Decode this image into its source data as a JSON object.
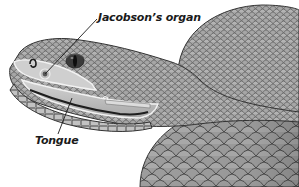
{
  "figure": {
    "labels": [
      {
        "id": "jacobsons-organ",
        "text": "Jacobson’s organ"
      },
      {
        "id": "tongue",
        "text": "Tongue"
      }
    ]
  },
  "colors": {
    "background": "#ffffff",
    "skin_light": "#b8b8b8",
    "skin_mid": "#9a9a9a",
    "skin_dark": "#6a6a6a",
    "scale_line": "#4a4a4a",
    "mouth_interior": "#c9c9c9",
    "leader_line": "#1a1a1a",
    "label_text": "#1a1a1a"
  }
}
